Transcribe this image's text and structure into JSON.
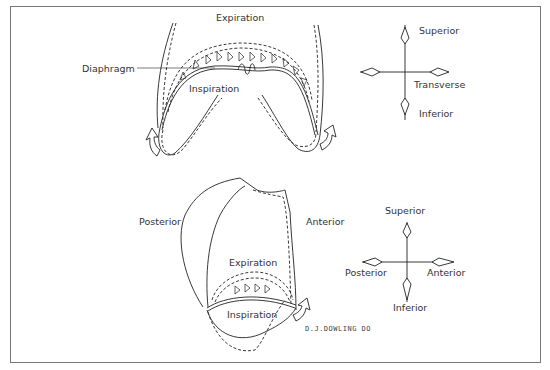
{
  "figure": {
    "top_panel": {
      "view": "frontal",
      "labels": {
        "expiration": "Expiration",
        "diaphragm": "Diaphragm",
        "inspiration": "Inspiration"
      },
      "compass": {
        "superior": "Superior",
        "transverse": "Transverse",
        "inferior": "Inferior"
      }
    },
    "bottom_panel": {
      "view": "lateral",
      "labels": {
        "posterior": "Posterior",
        "anterior": "Anterior",
        "expiration": "Expiration",
        "inspiration": "Inspiration"
      },
      "compass": {
        "superior": "Superior",
        "posterior": "Posterior",
        "anterior": "Anterior",
        "inferior": "Inferior"
      }
    },
    "signature": "D.J.DOWLING DO"
  },
  "colors": {
    "line": "#222222",
    "border": "#777777",
    "background": "#ffffff"
  }
}
